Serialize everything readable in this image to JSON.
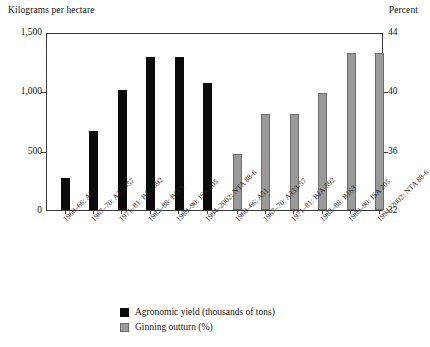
{
  "chart_data": {
    "type": "bar",
    "title": "",
    "left_axis_caption": "Kilograms per hectare",
    "right_axis_caption": "Percent",
    "grid": false,
    "legend_position": "bottom",
    "categories": [
      "1960–66: A51",
      "1967–70: A333-57",
      "1971–81: BJA-592",
      "1982–88: B163",
      "1989–90: ISA 205",
      "1994–2002: NTA 88-6"
    ],
    "left_axis": {
      "label": "Kilograms per hectare",
      "ticks": [
        "0",
        "500",
        "1,000",
        "1,500"
      ],
      "tick_values": [
        0,
        500,
        1000,
        1500
      ],
      "ylim": [
        0,
        1500
      ]
    },
    "right_axis": {
      "label": "Percent",
      "ticks": [
        "32",
        "36",
        "40",
        "44"
      ],
      "tick_values": [
        32,
        36,
        40,
        44
      ],
      "ylim": [
        32,
        44
      ]
    },
    "series": [
      {
        "name": "Agronomic yield (thousands of tons)",
        "color": "#0b0b0b",
        "axis": "left",
        "values": [
          270,
          670,
          1010,
          1290,
          1290,
          1070
        ]
      },
      {
        "name": "Ginning outturn (%)",
        "color": "#9a9a9a",
        "axis": "right",
        "values": [
          35.8,
          38.5,
          38.5,
          39.9,
          42.6,
          42.6
        ]
      }
    ]
  },
  "legend": {
    "entries": [
      {
        "label": "Agronomic yield (thousands of tons)",
        "swatch": "black"
      },
      {
        "label": "Ginning outturn (%)",
        "swatch": "gray"
      }
    ]
  }
}
